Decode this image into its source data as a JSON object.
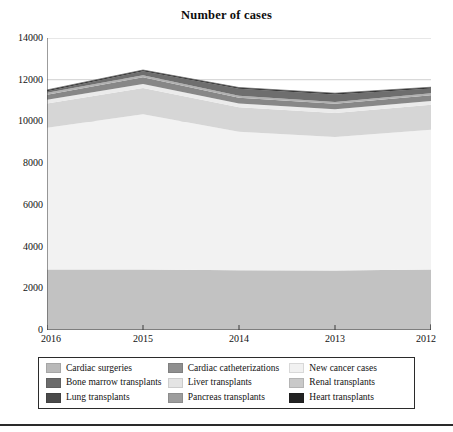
{
  "chart_data": {
    "type": "area",
    "stacked": true,
    "title": "Number of cases",
    "xlabel": "",
    "ylabel": "",
    "categories": [
      "2016",
      "2015",
      "2014",
      "2013",
      "2012"
    ],
    "ylim": [
      0,
      14000
    ],
    "ytick_values": [
      0,
      2000,
      4000,
      6000,
      8000,
      10000,
      12000,
      14000
    ],
    "ytick_labels": [
      "0",
      "2000",
      "4000",
      "6000",
      "8000",
      "10000",
      "12000",
      "14000"
    ],
    "grid": true,
    "grid_axis": "y",
    "legend_position": "bottom",
    "legend_columns": 3,
    "series": [
      {
        "name": "Cardiac catheterizations",
        "color": "#c2c2c2",
        "values": [
          2900,
          2900,
          2870,
          2850,
          2900
        ]
      },
      {
        "name": "New cancer cases",
        "color": "#f2f2f2",
        "values": [
          6800,
          7450,
          6630,
          6400,
          6700
        ]
      },
      {
        "name": "Cardiac surgeries",
        "color": "#9a9a9a",
        "values": [
          0,
          0,
          0,
          0,
          0
        ]
      },
      {
        "name": "Renal transplants",
        "color": "#d6d6d6",
        "values": [
          1160,
          1250,
          1180,
          1160,
          1200
        ]
      },
      {
        "name": "Liver transplants",
        "color": "#ebebeb",
        "values": [
          180,
          190,
          180,
          175,
          185
        ]
      },
      {
        "name": "Bone marrow transplants",
        "color": "#878787",
        "values": [
          240,
          330,
          280,
          260,
          270
        ]
      },
      {
        "name": "Pancreas transplants",
        "color": "#b0b0b0",
        "values": [
          90,
          100,
          95,
          90,
          95
        ]
      },
      {
        "name": "Lung transplants",
        "color": "#6e6e6e",
        "values": [
          80,
          180,
          330,
          360,
          230
        ]
      },
      {
        "name": "Heart transplants",
        "color": "#2b2b2b",
        "values": [
          60,
          65,
          60,
          60,
          60
        ]
      }
    ],
    "series_order_bottom_to_top": [
      "Cardiac catheterizations",
      "New cancer cases",
      "Renal transplants",
      "Liver transplants",
      "Bone marrow transplants",
      "Pancreas transplants",
      "Lung transplants",
      "Heart transplants",
      "Cardiac surgeries"
    ],
    "stack_totals": [
      11510,
      12465,
      11625,
      11355,
      11640
    ]
  },
  "legend": {
    "items": [
      {
        "label": "Cardiac surgeries",
        "color": "#b9b9b9"
      },
      {
        "label": "Cardiac catheterizations",
        "color": "#8f8f8f"
      },
      {
        "label": "New cancer cases",
        "color": "#f1f1f1"
      },
      {
        "label": "Bone marrow transplants",
        "color": "#6b6b6b"
      },
      {
        "label": "Liver transplants",
        "color": "#e4e4e4"
      },
      {
        "label": "Renal transplants",
        "color": "#c9c9c9"
      },
      {
        "label": "Lung transplants",
        "color": "#4a4a4a"
      },
      {
        "label": "Pancreas transplants",
        "color": "#9d9d9d"
      },
      {
        "label": "Heart transplants",
        "color": "#232323"
      }
    ]
  },
  "colors": {
    "axis": "#3a3a3a",
    "grid": "#c9c9c9",
    "text": "#111111",
    "background": "#ffffff"
  }
}
